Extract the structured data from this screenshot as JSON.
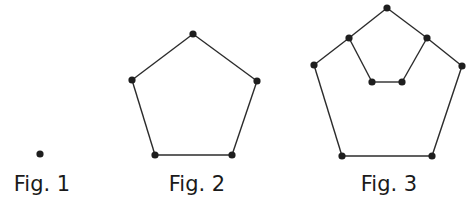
{
  "figures": [
    {
      "label": "Fig. 1",
      "label_x": 42,
      "nodes": [
        [
          40,
          154
        ]
      ],
      "edges": []
    },
    {
      "label": "Fig. 2",
      "label_x": 197,
      "nodes": [
        [
          193,
          34
        ],
        [
          132,
          80
        ],
        [
          257,
          81
        ],
        [
          155,
          155
        ],
        [
          232,
          155
        ]
      ],
      "edges": [
        [
          0,
          1
        ],
        [
          0,
          2
        ],
        [
          1,
          3
        ],
        [
          2,
          4
        ],
        [
          3,
          4
        ]
      ]
    },
    {
      "label": "Fig. 3",
      "label_x": 389,
      "nodes": [
        [
          387,
          8
        ],
        [
          349,
          38
        ],
        [
          427,
          38
        ],
        [
          314,
          65
        ],
        [
          462,
          66
        ],
        [
          372,
          82
        ],
        [
          402,
          82
        ],
        [
          342,
          156
        ],
        [
          432,
          156
        ]
      ],
      "edges": [
        [
          0,
          1
        ],
        [
          0,
          2
        ],
        [
          1,
          3
        ],
        [
          2,
          4
        ],
        [
          1,
          5
        ],
        [
          2,
          6
        ],
        [
          5,
          6
        ],
        [
          3,
          7
        ],
        [
          4,
          8
        ],
        [
          7,
          8
        ]
      ]
    }
  ],
  "colors": {
    "node": "#1e1e1e",
    "edge": "#2b2b2b",
    "text": "#1a1a1a"
  }
}
